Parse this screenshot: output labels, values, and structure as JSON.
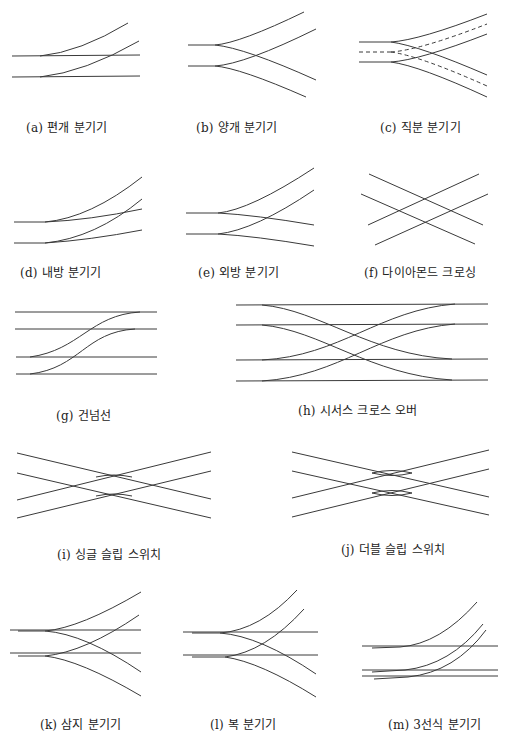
{
  "figure": {
    "panels": [
      {
        "id": "a",
        "caption": "(a) 편개 분기기",
        "name": "simple-turnout"
      },
      {
        "id": "b",
        "caption": "(b) 양개 분기기",
        "name": "double-sided-turnout"
      },
      {
        "id": "c",
        "caption": "(c) 직분 분기기",
        "name": "unsymmetrical-split-turnout"
      },
      {
        "id": "d",
        "caption": "(d) 내방 분기기",
        "name": "curved-inner-turnout"
      },
      {
        "id": "e",
        "caption": "(e) 외방 분기기",
        "name": "curved-outer-turnout"
      },
      {
        "id": "f",
        "caption": "(f) 다이아몬드 크로싱",
        "name": "diamond-crossing"
      },
      {
        "id": "g",
        "caption": "(g) 건넘선",
        "name": "crossover"
      },
      {
        "id": "h",
        "caption": "(h) 시서스 크로스 오버",
        "name": "scissors-crossover"
      },
      {
        "id": "i",
        "caption": "(i) 싱글 슬립 스위치",
        "name": "single-slip-switch"
      },
      {
        "id": "j",
        "caption": "(j) 더블 슬립 스위치",
        "name": "double-slip-switch"
      },
      {
        "id": "k",
        "caption": "(k) 삼지 분기기",
        "name": "three-way-turnout"
      },
      {
        "id": "l",
        "caption": "(l) 복 분기기",
        "name": "tandem-turnout"
      },
      {
        "id": "m",
        "caption": "(m) 3선식 분기기",
        "name": "three-rail-turnout"
      }
    ]
  },
  "colors": {
    "line": "#3a3a3a",
    "text": "#222222",
    "background": "#ffffff"
  }
}
